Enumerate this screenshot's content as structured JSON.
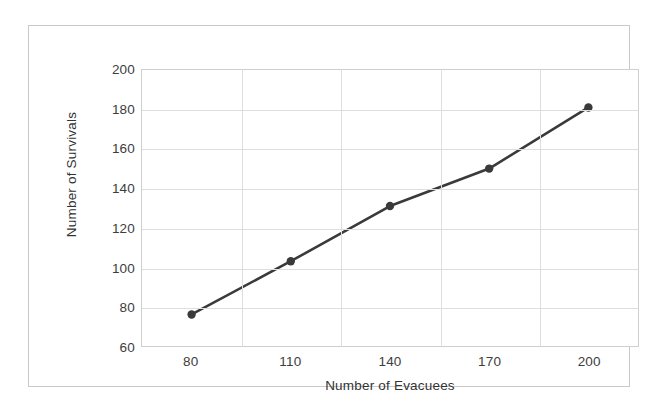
{
  "chart_data": {
    "type": "line",
    "title": "",
    "xlabel": "Number of Evacuees",
    "ylabel": "Number of Survivals",
    "categories": [
      "80",
      "110",
      "140",
      "170",
      "200"
    ],
    "x": [
      80,
      110,
      140,
      170,
      200
    ],
    "values": [
      76,
      103,
      131,
      150,
      181
    ],
    "series": [
      {
        "name": "Number of Survivals",
        "values": [
          76,
          103,
          131,
          150,
          181
        ]
      }
    ],
    "xtick_labels": [
      "80",
      "110",
      "140",
      "170",
      "200"
    ],
    "ytick_labels": [
      "60",
      "80",
      "100",
      "120",
      "140",
      "160",
      "180",
      "200"
    ],
    "ytick_values": [
      60,
      80,
      100,
      120,
      140,
      160,
      180,
      200
    ],
    "ylim": [
      60,
      200
    ],
    "grid": "horizontal-and-vertical",
    "legend": "none",
    "marker": "filled-circle",
    "series_color": "#3a3a3a",
    "grid_color": "#dedede",
    "axis_text_color": "#3d3d3d",
    "plot_background": "#ffffff",
    "frame_color": "#c9c9c9"
  }
}
